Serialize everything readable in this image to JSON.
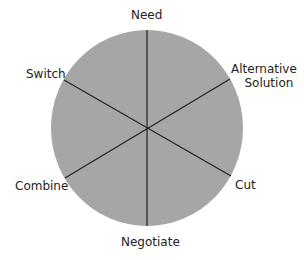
{
  "diagram": {
    "fill_color": "#a6a6a6",
    "line_color": "#222222",
    "center": "",
    "segments": [
      {
        "label": "Need"
      },
      {
        "label_line1": "Alternative",
        "label_line2": "Solution"
      },
      {
        "label": "Cut"
      },
      {
        "label": "Negotiate"
      },
      {
        "label": "Combine"
      },
      {
        "label": "Switch"
      }
    ]
  }
}
